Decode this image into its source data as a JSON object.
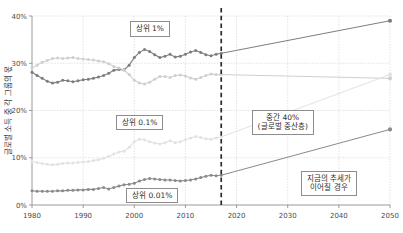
{
  "chart_data": {
    "type": "line",
    "title": "",
    "xlabel": "",
    "ylabel": "글로벌 소득 중 각 그룹의 몫",
    "xlim": [
      1980,
      2050
    ],
    "ylim": [
      0,
      40
    ],
    "grid": true,
    "legend_position": "inline-annotations",
    "x_ticks": [
      "1980",
      "1990",
      "2000",
      "2010",
      "2020",
      "2030",
      "2040",
      "2050"
    ],
    "x_tick_values": [
      1980,
      1990,
      2000,
      2010,
      2020,
      2030,
      2040,
      2050
    ],
    "y_ticks": [
      "0%",
      "10%",
      "20%",
      "30%",
      "40%"
    ],
    "y_tick_values": [
      0,
      10,
      20,
      30,
      40
    ],
    "projection_start_year": 2017,
    "series": [
      {
        "name": "상위 1%",
        "color": "#7d7d7d",
        "x": [
          1980,
          1981,
          1982,
          1983,
          1984,
          1985,
          1986,
          1987,
          1988,
          1989,
          1990,
          1991,
          1992,
          1993,
          1994,
          1995,
          1996,
          1997,
          1998,
          1999,
          2000,
          2001,
          2002,
          2003,
          2004,
          2005,
          2006,
          2007,
          2008,
          2009,
          2010,
          2011,
          2012,
          2013,
          2014,
          2015,
          2016,
          2017
        ],
        "values": [
          28.1,
          27.4,
          26.8,
          26.2,
          25.8,
          26.0,
          26.4,
          26.3,
          26.1,
          26.3,
          26.5,
          26.6,
          26.8,
          27.1,
          27.4,
          27.9,
          28.5,
          28.7,
          28.6,
          29.6,
          31.2,
          32.3,
          32.9,
          32.5,
          31.8,
          31.2,
          31.5,
          31.9,
          31.3,
          31.5,
          31.9,
          32.4,
          32.7,
          32.3,
          31.8,
          31.6,
          31.9,
          32.1
        ],
        "projection_x": [
          2017,
          2050
        ],
        "projection_values": [
          32.1,
          39.0
        ]
      },
      {
        "name": "중간 40% (글로벌 중산층)",
        "color": "#cfcfcf",
        "x": [
          1980,
          1981,
          1982,
          1983,
          1984,
          1985,
          1986,
          1987,
          1988,
          1989,
          1990,
          1991,
          1992,
          1993,
          1994,
          1995,
          1996,
          1997,
          1998,
          1999,
          2000,
          2001,
          2002,
          2003,
          2004,
          2005,
          2006,
          2007,
          2008,
          2009,
          2010,
          2011,
          2012,
          2013,
          2014,
          2015,
          2016,
          2017
        ],
        "values": [
          29.0,
          29.6,
          30.2,
          30.6,
          31.0,
          31.1,
          31.0,
          31.1,
          31.2,
          31.0,
          30.9,
          30.8,
          30.7,
          30.5,
          30.3,
          29.9,
          29.3,
          29.0,
          28.5,
          27.6,
          26.4,
          25.8,
          25.6,
          26.0,
          26.6,
          27.2,
          27.2,
          27.0,
          27.4,
          27.5,
          27.3,
          26.9,
          26.6,
          27.0,
          27.4,
          27.7,
          27.6,
          27.6
        ],
        "projection_x": [
          2017,
          2050
        ],
        "projection_values": [
          27.6,
          26.8
        ]
      },
      {
        "name": "상위 0.1%",
        "color": "#e2e2e2",
        "x": [
          1980,
          1981,
          1982,
          1983,
          1984,
          1985,
          1986,
          1987,
          1988,
          1989,
          1990,
          1991,
          1992,
          1993,
          1994,
          1995,
          1996,
          1997,
          1998,
          1999,
          2000,
          2001,
          2002,
          2003,
          2004,
          2005,
          2006,
          2007,
          2008,
          2009,
          2010,
          2011,
          2012,
          2013,
          2014,
          2015,
          2016,
          2017
        ],
        "values": [
          9.2,
          9.0,
          8.8,
          8.6,
          8.5,
          8.6,
          8.8,
          8.9,
          8.9,
          9.0,
          9.1,
          9.2,
          9.4,
          9.6,
          9.9,
          10.3,
          10.8,
          11.2,
          11.4,
          12.2,
          13.4,
          13.9,
          13.8,
          13.4,
          13.1,
          12.9,
          13.2,
          13.6,
          13.2,
          13.4,
          13.8,
          14.2,
          14.5,
          14.3,
          14.0,
          13.9,
          14.2,
          14.4
        ],
        "projection_x": [
          2017,
          2050
        ],
        "projection_values": [
          14.4,
          27.6
        ]
      },
      {
        "name": "상위 0.01%",
        "color": "#8a8a8a",
        "x": [
          1980,
          1981,
          1982,
          1983,
          1984,
          1985,
          1986,
          1987,
          1988,
          1989,
          1990,
          1991,
          1992,
          1993,
          1994,
          1995,
          1996,
          1997,
          1998,
          1999,
          2000,
          2001,
          2002,
          2003,
          2004,
          2005,
          2006,
          2007,
          2008,
          2009,
          2010,
          2011,
          2012,
          2013,
          2014,
          2015,
          2016,
          2017
        ],
        "values": [
          3.0,
          2.9,
          2.9,
          2.9,
          2.9,
          3.0,
          3.0,
          3.1,
          3.1,
          3.2,
          3.2,
          3.3,
          3.3,
          3.5,
          3.7,
          3.4,
          3.7,
          4.0,
          4.3,
          4.4,
          4.6,
          5.1,
          5.4,
          5.6,
          5.5,
          5.4,
          5.3,
          5.3,
          5.2,
          5.1,
          5.2,
          5.3,
          5.5,
          5.8,
          6.1,
          6.3,
          6.2,
          6.3
        ],
        "projection_x": [
          2017,
          2050
        ],
        "projection_values": [
          6.3,
          16.0
        ]
      }
    ],
    "annotations": [
      {
        "id": "top1",
        "text": "상위 1%",
        "text2": ""
      },
      {
        "id": "top01",
        "text": "상위 0.1%",
        "text2": ""
      },
      {
        "id": "top001",
        "text": "상위 0.01%",
        "text2": ""
      },
      {
        "id": "middle40",
        "text": "중간 40%",
        "text2": "(글로벌 중산층)"
      },
      {
        "id": "trend",
        "text": "지금의 추세가",
        "text2": "이어질 경우"
      }
    ]
  },
  "axis": {
    "y_label": "글로벌 소득 중 각 그룹의 몫",
    "y_tick_0": "0%",
    "y_tick_1": "10%",
    "y_tick_2": "20%",
    "y_tick_3": "30%",
    "y_tick_4": "40%",
    "x_tick_0": "1980",
    "x_tick_1": "1990",
    "x_tick_2": "2000",
    "x_tick_3": "2010",
    "x_tick_4": "2020",
    "x_tick_5": "2030",
    "x_tick_6": "2040",
    "x_tick_7": "2050"
  },
  "labels": {
    "top1": "상위 1%",
    "top01": "상위 0.1%",
    "top001": "상위 0.01%",
    "middle40_l1": "중간 40%",
    "middle40_l2": "(글로벌 중산층)",
    "trend_l1": "지금의 추세가",
    "trend_l2": "이어질 경우"
  },
  "colors": {
    "top1": "#7d7d7d",
    "middle40": "#cfcfcf",
    "top01": "#e2e2e2",
    "top001": "#8a8a8a",
    "grid": "#cfcfcf",
    "axis": "#9a9a9a",
    "divider": "#2b2b2b"
  }
}
